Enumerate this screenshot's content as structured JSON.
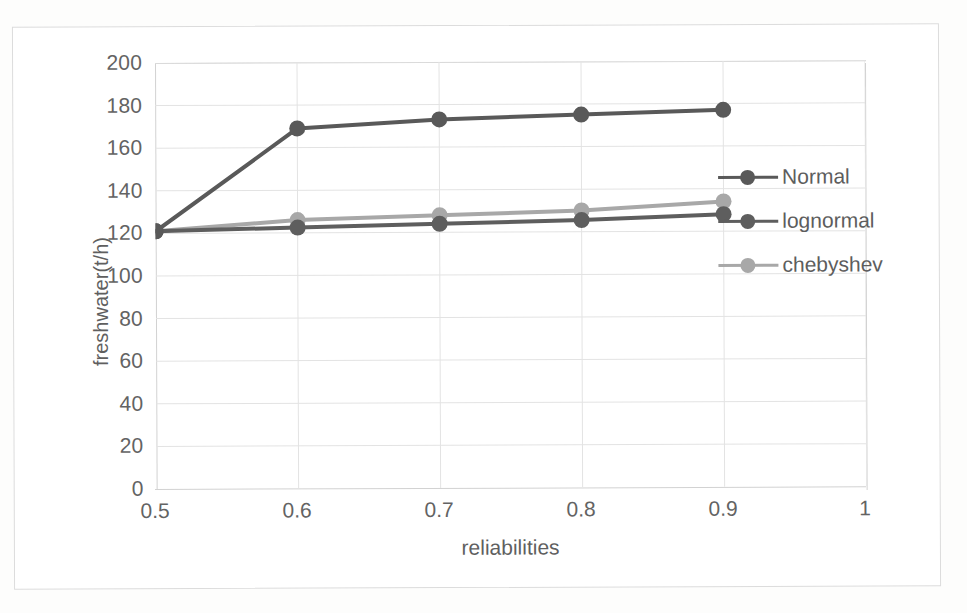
{
  "chart_data": {
    "type": "line",
    "title": "",
    "subtitle": "",
    "xlabel": "reliabilities",
    "ylabel": "freshwater(t/h)",
    "x": [
      0.5,
      0.6,
      0.7,
      0.8,
      0.9
    ],
    "xticks": [
      "0.5",
      "0.6",
      "0.7",
      "0.8",
      "0.9",
      "1"
    ],
    "xtick_values": [
      0.5,
      0.6,
      0.7,
      0.8,
      0.9,
      1
    ],
    "yticks": [
      "0",
      "20",
      "40",
      "60",
      "80",
      "100",
      "120",
      "140",
      "160",
      "180",
      "200"
    ],
    "ytick_values": [
      0,
      20,
      40,
      60,
      80,
      100,
      120,
      140,
      160,
      180,
      200
    ],
    "xlim": [
      0.5,
      1
    ],
    "ylim": [
      0,
      200
    ],
    "grid": true,
    "grid_axis": "both",
    "legend_position": "inside-right",
    "series": [
      {
        "name": "Normal",
        "color": "#595959",
        "marker": "circle",
        "values": [
          121,
          169,
          173,
          175,
          177
        ]
      },
      {
        "name": "lognormal",
        "color": "#5e5e5e",
        "marker": "circle",
        "values": [
          121,
          122.5,
          124,
          125.5,
          128
        ]
      },
      {
        "name": "chebyshev",
        "color": "#a8a8a8",
        "marker": "circle",
        "values": [
          121,
          126,
          128,
          130,
          134
        ]
      }
    ]
  },
  "legend": {
    "entries": [
      {
        "label": "Normal",
        "color": "#595959"
      },
      {
        "label": "lognormal",
        "color": "#5e5e5e"
      },
      {
        "label": "chebyshev",
        "color": "#a8a8a8"
      }
    ]
  },
  "axes": {
    "y_label": "freshwater(t/h)",
    "x_label": "reliabilities"
  },
  "colors": {
    "grid": "#e3e3e3",
    "axis": "#d2d2d2",
    "tick_text": "#636363",
    "label_text": "#5f5f5f",
    "page_background": "#fdfdfc",
    "plot_background": "#ffffff"
  }
}
